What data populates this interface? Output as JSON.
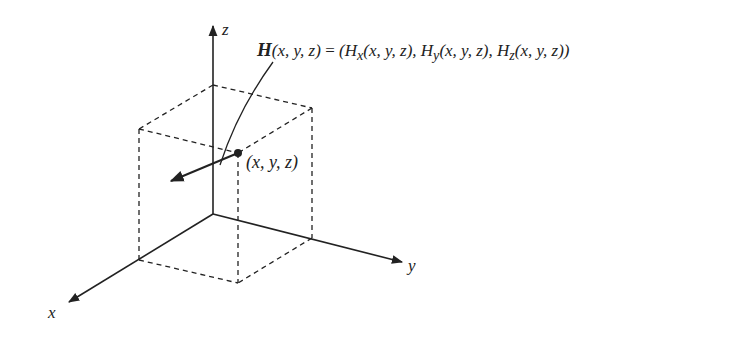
{
  "diagram": {
    "axes": {
      "x_label": "x",
      "y_label": "y",
      "z_label": "z"
    },
    "point_label": "(x, y, z)",
    "equation": {
      "lhs_symbol": "H",
      "lhs_args": "(x, y, z)",
      "equals": " = ",
      "rhs": "(H",
      "comp_x_sub": "x",
      "comp_x_args": "(x, y, z), H",
      "comp_y_sub": "y",
      "comp_y_args": "(x, y, z), H",
      "comp_z_sub": "z",
      "comp_z_args": "(x, y, z))"
    },
    "colors": {
      "stroke": "#222222",
      "background": "#ffffff"
    }
  }
}
